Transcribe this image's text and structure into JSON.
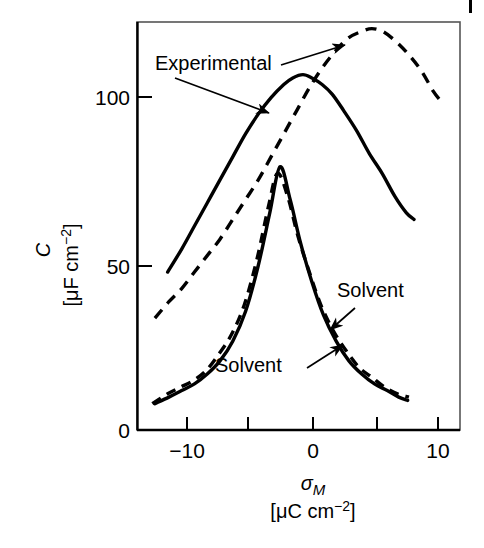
{
  "figure": {
    "background_color": "#ffffff",
    "line_color": "#000000",
    "page_marker": "|"
  },
  "axes": {
    "x": {
      "title_symbol": "σ",
      "title_subscript": "M",
      "units": "[μC cm",
      "units_exponent": "−2",
      "units_close": "]",
      "ticks": [
        -10,
        -5,
        0,
        5,
        10
      ],
      "tick_labels": [
        "−10",
        "",
        "0",
        "",
        "10"
      ],
      "range": [
        -13.0,
        12.3
      ]
    },
    "y": {
      "title_symbol": "C",
      "units": "[μF cm",
      "units_exponent": "−2",
      "units_close": "]",
      "ticks": [
        0,
        50,
        100
      ],
      "tick_labels": [
        "0",
        "50",
        "100"
      ],
      "range": [
        0,
        124
      ]
    }
  },
  "annotations": [
    {
      "name": "experimental",
      "label": "Experimental",
      "x": 155,
      "y": 70
    },
    {
      "name": "solvent-upper",
      "label": "Solvent",
      "x": 337,
      "y": 297
    },
    {
      "name": "solvent-lower",
      "label": "Solvent",
      "x": 215,
      "y": 372
    }
  ],
  "chart_data": {
    "type": "line",
    "title": "",
    "xlabel": "σ_M [μC cm−2]",
    "ylabel": "C [μF cm−2]",
    "xlim": [
      -13.0,
      12.3
    ],
    "ylim": [
      0,
      124
    ],
    "xticks": [
      -10,
      -5,
      0,
      5,
      10
    ],
    "yticks": [
      0,
      50,
      100
    ],
    "grid": false,
    "legend": "none (curves labelled with arrow annotations)",
    "series": [
      {
        "name": "Experimental (upper, solid)",
        "style": "solid",
        "label_ref": "Experimental",
        "x": [
          -10.6,
          -9.5,
          -8.5,
          -7.5,
          -6.5,
          -5.5,
          -4.5,
          -3.5,
          -2.5,
          -1.5,
          -0.8,
          0.0,
          0.7,
          1.5,
          2.3,
          3.2,
          4.2,
          5.2,
          6.2,
          7.2,
          8.1,
          8.7
        ],
        "y": [
          48,
          55,
          62,
          69,
          76,
          83,
          90,
          96,
          101,
          105,
          107,
          108,
          107,
          105,
          102,
          97,
          91,
          84,
          78,
          71,
          66,
          64
        ]
      },
      {
        "name": "Theoretical (upper, dashed)",
        "style": "dashed",
        "label_ref": "Experimental",
        "x": [
          -11.6,
          -10.5,
          -9.5,
          -8.5,
          -7.5,
          -6.5,
          -5.5,
          -4.5,
          -3.5,
          -2.5,
          -1.5,
          -0.5,
          0.5,
          1.5,
          2.5,
          3.5,
          4.5,
          5.4,
          6.3,
          7.3,
          8.3,
          9.3,
          10.2,
          10.8
        ],
        "y": [
          34,
          39,
          43,
          48,
          53,
          58,
          64,
          70,
          76,
          83,
          90,
          97,
          104,
          110,
          115,
          119,
          121,
          122,
          121,
          118,
          114,
          109,
          103,
          100
        ]
      },
      {
        "name": "Solvent (lower, solid)",
        "style": "solid",
        "label_ref": "Solvent",
        "x": [
          -11.6,
          -10.5,
          -9.5,
          -8.5,
          -7.5,
          -6.5,
          -5.5,
          -4.5,
          -3.5,
          -2.6,
          -1.8,
          -1.0,
          -0.2,
          0.7,
          1.6,
          2.6,
          3.6,
          4.6,
          5.6,
          6.6,
          7.5,
          8.2
        ],
        "y": [
          8,
          10,
          12,
          14,
          17,
          21,
          27,
          36,
          50,
          66,
          80,
          70,
          57,
          45,
          35,
          27,
          21,
          17,
          14,
          12,
          10,
          9
        ]
      },
      {
        "name": "Solvent (lower, dashed)",
        "style": "dashed",
        "label_ref": "Solvent",
        "x": [
          -11.8,
          -10.6,
          -9.6,
          -8.6,
          -7.6,
          -6.6,
          -5.6,
          -4.6,
          -3.6,
          -2.7,
          -2.0,
          -1.2,
          -0.4,
          0.5,
          1.4,
          2.4,
          3.4,
          4.4,
          5.4,
          6.4,
          7.4,
          8.3
        ],
        "y": [
          8,
          11,
          13,
          15,
          18,
          23,
          29,
          38,
          52,
          68,
          78,
          71,
          59,
          48,
          38,
          30,
          24,
          19,
          16,
          13,
          11,
          10
        ]
      }
    ],
    "arrows": [
      {
        "name": "arrow-experimental-to-solid",
        "from": [
          175,
          78
        ],
        "to": [
          269,
          113
        ]
      },
      {
        "name": "arrow-experimental-to-dashed",
        "from": [
          281,
          65
        ],
        "to": [
          345,
          45
        ]
      },
      {
        "name": "arrow-solvent-upper-to-curve",
        "from": [
          355,
          308
        ],
        "to": [
          330,
          330
        ]
      },
      {
        "name": "arrow-solvent-lower-to-curve",
        "from": [
          307,
          368
        ],
        "to": [
          343,
          345
        ]
      }
    ]
  }
}
